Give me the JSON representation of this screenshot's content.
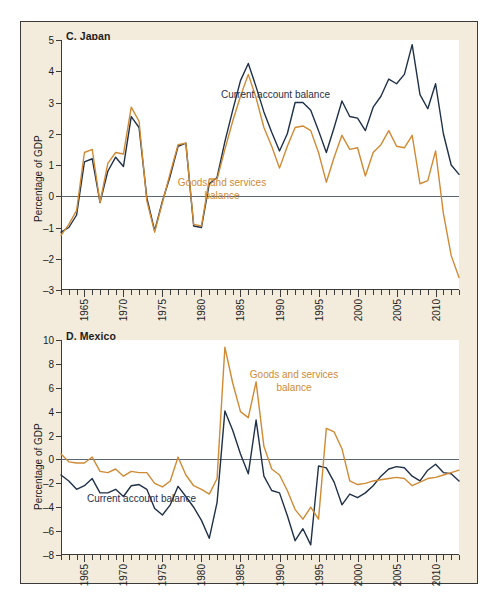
{
  "figure": {
    "background_color": "#f3ecdd",
    "plot_background_color": "#ffffff",
    "border_color": "#3b3b3b",
    "series_colors": {
      "current_account_balance": "#1f3048",
      "goods_and_services_balance": "#d08a33"
    }
  },
  "panels": [
    {
      "id": "japan",
      "title": "C. Japan",
      "ylabel": "Percentage of GDP"
    },
    {
      "id": "mexico",
      "title": "D. Mexico",
      "ylabel": "Percentage of GDP"
    }
  ],
  "annotations": {
    "japan_current_account": "Current account balance",
    "japan_goods_line1": "Goods and services",
    "japan_goods_line2": "balance",
    "mexico_goods_line1": "Goods and services",
    "mexico_goods_line2": "balance",
    "mexico_current_account": "Current account balance"
  },
  "chart_data": [
    {
      "type": "line",
      "title": "C. Japan",
      "xlabel": "",
      "ylabel": "Percentage of GDP",
      "xlim": [
        1962,
        2013
      ],
      "ylim": [
        -3,
        5
      ],
      "yticks": [
        -3,
        -2,
        -1,
        0,
        1,
        2,
        3,
        4,
        5
      ],
      "xticks": [
        1965,
        1970,
        1975,
        1980,
        1985,
        1990,
        1995,
        2000,
        2005,
        2010
      ],
      "grid": false,
      "legend": "inline-annotations",
      "x": [
        1962,
        1963,
        1964,
        1965,
        1966,
        1967,
        1968,
        1969,
        1970,
        1971,
        1972,
        1973,
        1974,
        1975,
        1976,
        1977,
        1978,
        1979,
        1980,
        1981,
        1982,
        1983,
        1984,
        1985,
        1986,
        1987,
        1988,
        1989,
        1990,
        1991,
        1992,
        1993,
        1994,
        1995,
        1996,
        1997,
        1998,
        1999,
        2000,
        2001,
        2002,
        2003,
        2004,
        2005,
        2006,
        2007,
        2008,
        2009,
        2010,
        2011,
        2012,
        2013
      ],
      "series": [
        {
          "name": "Current account balance",
          "color": "#1f3048",
          "values": [
            -1.15,
            -1.0,
            -0.6,
            1.1,
            1.2,
            -0.2,
            0.8,
            1.25,
            0.95,
            2.55,
            2.2,
            -0.05,
            -1.1,
            -0.15,
            0.65,
            1.6,
            1.7,
            -0.95,
            -1.0,
            0.4,
            0.6,
            1.75,
            2.75,
            3.7,
            4.25,
            3.5,
            2.7,
            2.05,
            1.45,
            2.0,
            3.0,
            3.0,
            2.75,
            2.1,
            1.4,
            2.2,
            3.05,
            2.55,
            2.5,
            2.1,
            2.85,
            3.2,
            3.75,
            3.6,
            3.9,
            4.85,
            3.25,
            2.8,
            3.6,
            2.0,
            1.0,
            0.7
          ]
        },
        {
          "name": "Goods and services balance",
          "color": "#d08a33",
          "values": [
            -1.25,
            -0.9,
            -0.45,
            1.4,
            1.5,
            -0.2,
            1.05,
            1.4,
            1.35,
            2.85,
            2.4,
            -0.15,
            -1.15,
            -0.2,
            0.75,
            1.65,
            1.7,
            -0.9,
            -0.95,
            0.55,
            0.55,
            1.5,
            2.4,
            3.2,
            3.9,
            3.15,
            2.2,
            1.6,
            0.9,
            1.6,
            2.2,
            2.25,
            2.1,
            1.4,
            0.45,
            1.25,
            1.95,
            1.5,
            1.55,
            0.65,
            1.4,
            1.65,
            2.1,
            1.6,
            1.55,
            1.95,
            0.4,
            0.5,
            1.45,
            -0.55,
            -1.9,
            -2.6
          ]
        }
      ]
    },
    {
      "type": "line",
      "title": "D. Mexico",
      "xlabel": "",
      "ylabel": "Percentage of GDP",
      "xlim": [
        1962,
        2013
      ],
      "ylim": [
        -8,
        10
      ],
      "yticks": [
        -8,
        -6,
        -4,
        -2,
        0,
        2,
        4,
        6,
        8,
        10
      ],
      "xticks": [
        1965,
        1970,
        1975,
        1980,
        1985,
        1990,
        1995,
        2000,
        2005,
        2010
      ],
      "grid": false,
      "legend": "inline-annotations",
      "x": [
        1962,
        1963,
        1964,
        1965,
        1966,
        1967,
        1968,
        1969,
        1970,
        1971,
        1972,
        1973,
        1974,
        1975,
        1976,
        1977,
        1978,
        1979,
        1980,
        1981,
        1982,
        1983,
        1984,
        1985,
        1986,
        1987,
        1988,
        1989,
        1990,
        1991,
        1992,
        1993,
        1994,
        1995,
        1996,
        1997,
        1998,
        1999,
        2000,
        2001,
        2002,
        2003,
        2004,
        2005,
        2006,
        2007,
        2008,
        2009,
        2010,
        2011,
        2012,
        2013
      ],
      "series": [
        {
          "name": "Current account balance",
          "color": "#1f3048",
          "values": [
            -1.3,
            -1.8,
            -2.5,
            -2.2,
            -1.6,
            -2.8,
            -2.8,
            -2.5,
            -3.1,
            -2.2,
            -2.1,
            -2.5,
            -4.1,
            -4.65,
            -3.8,
            -2.25,
            -3.1,
            -4.0,
            -5.1,
            -6.6,
            -3.6,
            4.05,
            2.45,
            0.45,
            -1.2,
            3.3,
            -1.4,
            -2.6,
            -2.8,
            -4.7,
            -6.8,
            -5.8,
            -7.15,
            -0.55,
            -0.7,
            -1.9,
            -3.8,
            -2.9,
            -3.2,
            -2.8,
            -2.2,
            -1.4,
            -0.8,
            -0.6,
            -0.7,
            -1.4,
            -1.8,
            -0.9,
            -0.4,
            -1.1,
            -1.2,
            -1.8
          ]
        },
        {
          "name": "Goods and services balance",
          "color": "#d08a33",
          "values": [
            0.45,
            -0.2,
            -0.3,
            -0.3,
            0.2,
            -1.0,
            -1.1,
            -0.8,
            -1.4,
            -1.0,
            -1.1,
            -1.1,
            -2.0,
            -2.3,
            -1.8,
            0.2,
            -1.3,
            -2.2,
            -2.5,
            -2.9,
            -1.6,
            9.4,
            6.4,
            4.0,
            3.5,
            6.5,
            1.1,
            -0.8,
            -1.3,
            -2.6,
            -4.2,
            -5.0,
            -4.0,
            -5.0,
            2.6,
            2.3,
            0.9,
            -1.8,
            -2.1,
            -2.0,
            -1.8,
            -1.7,
            -1.6,
            -1.5,
            -1.6,
            -2.2,
            -1.9,
            -1.6,
            -1.5,
            -1.3,
            -1.1,
            -0.9
          ]
        }
      ]
    }
  ]
}
